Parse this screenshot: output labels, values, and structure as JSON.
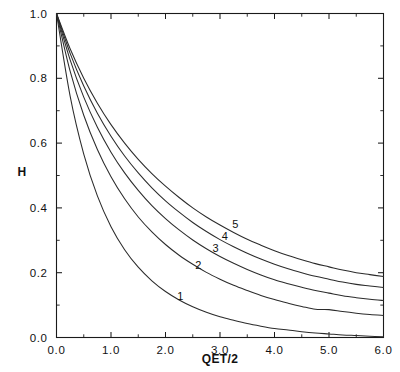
{
  "chart_data": {
    "type": "line",
    "title": "",
    "subtitle": "",
    "xlabel": "QET/2",
    "ylabel": "H",
    "xlim": [
      0.0,
      6.0
    ],
    "ylim": [
      0.0,
      1.0
    ],
    "grid": false,
    "legend_position": "inline-curve-labels",
    "x_ticks": [
      "0.0",
      "1.0",
      "2.0",
      "3.0",
      "4.0",
      "5.0",
      "6.0"
    ],
    "x_tick_values": [
      0.0,
      1.0,
      2.0,
      3.0,
      4.0,
      5.0,
      6.0
    ],
    "x_minor_ticks": [
      0.5,
      1.5,
      2.5,
      3.5,
      4.5,
      5.5
    ],
    "y_ticks": [
      "0.0",
      "0.2",
      "0.4",
      "0.6",
      "0.8",
      "1.0"
    ],
    "y_tick_values": [
      0.0,
      0.2,
      0.4,
      0.6,
      0.8,
      1.0
    ],
    "y_minor_ticks": [
      0.1,
      0.3,
      0.5,
      0.7,
      0.9
    ],
    "x": [
      0.0,
      0.25,
      0.5,
      0.75,
      1.0,
      1.25,
      1.5,
      1.75,
      2.0,
      2.25,
      2.5,
      2.75,
      3.0,
      3.25,
      3.5,
      3.75,
      4.0,
      4.25,
      4.5,
      4.75,
      5.0,
      5.25,
      5.5,
      5.75,
      6.0
    ],
    "series": [
      {
        "name": "1",
        "label": "1",
        "label_x": 2.27,
        "label_y": 0.115,
        "values": [
          1.0,
          0.745,
          0.566,
          0.437,
          0.342,
          0.271,
          0.217,
          0.175,
          0.142,
          0.116,
          0.095,
          0.078,
          0.064,
          0.053,
          0.043,
          0.035,
          0.028,
          0.023,
          0.018,
          0.014,
          0.011,
          0.008,
          0.006,
          0.004,
          0.002
        ]
      },
      {
        "name": "2",
        "label": "2",
        "label_x": 2.6,
        "label_y": 0.21,
        "values": [
          1.0,
          0.822,
          0.686,
          0.58,
          0.496,
          0.428,
          0.372,
          0.326,
          0.287,
          0.254,
          0.226,
          0.201,
          0.18,
          0.161,
          0.145,
          0.13,
          0.117,
          0.106,
          0.096,
          0.087,
          0.086,
          0.08,
          0.075,
          0.071,
          0.068
        ]
      },
      {
        "name": "3",
        "label": "3",
        "label_x": 2.92,
        "label_y": 0.264,
        "values": [
          1.0,
          0.857,
          0.742,
          0.649,
          0.572,
          0.508,
          0.454,
          0.407,
          0.367,
          0.332,
          0.301,
          0.274,
          0.25,
          0.229,
          0.21,
          0.193,
          0.178,
          0.166,
          0.155,
          0.145,
          0.137,
          0.129,
          0.123,
          0.118,
          0.114
        ]
      },
      {
        "name": "4",
        "label": "4",
        "label_x": 3.09,
        "label_y": 0.3,
        "values": [
          1.0,
          0.877,
          0.776,
          0.692,
          0.621,
          0.56,
          0.508,
          0.462,
          0.422,
          0.387,
          0.355,
          0.327,
          0.302,
          0.28,
          0.26,
          0.242,
          0.226,
          0.212,
          0.2,
          0.189,
          0.18,
          0.171,
          0.164,
          0.159,
          0.154
        ]
      },
      {
        "name": "5",
        "label": "5",
        "label_x": 3.28,
        "label_y": 0.338,
        "values": [
          1.0,
          0.891,
          0.8,
          0.723,
          0.657,
          0.6,
          0.55,
          0.506,
          0.467,
          0.432,
          0.4,
          0.372,
          0.347,
          0.324,
          0.303,
          0.285,
          0.268,
          0.253,
          0.24,
          0.228,
          0.218,
          0.208,
          0.2,
          0.194,
          0.188
        ]
      }
    ]
  }
}
